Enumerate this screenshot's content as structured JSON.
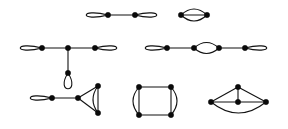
{
  "figure": {
    "width": 288,
    "height": 129,
    "background_color": "#ffffff",
    "vertex_color": "#0a0a0a",
    "edge_color": "#111111",
    "vertex_radius": 2.7,
    "edge_width": 1.1
  },
  "chart_data": {
    "type": "diagram",
    "graphs": [
      {
        "id": "graph-top-left",
        "label": "two looped vertices joined by an edge",
        "vertices": [
          {
            "id": "a",
            "x": 108,
            "y": 15
          },
          {
            "id": "b",
            "x": 135,
            "y": 15
          }
        ],
        "edges": [
          {
            "from": "a",
            "to": "b",
            "kind": "straight",
            "curve": 0
          }
        ],
        "loops": [
          {
            "at": "a",
            "direction": "left",
            "length": 29,
            "width": 15
          },
          {
            "at": "b",
            "direction": "right",
            "length": 29,
            "width": 15
          }
        ]
      },
      {
        "id": "graph-top-right",
        "label": "two vertices joined by three parallel edges",
        "vertices": [
          {
            "id": "a",
            "x": 181,
            "y": 15
          },
          {
            "id": "b",
            "x": 207,
            "y": 15
          }
        ],
        "edges": [
          {
            "from": "a",
            "to": "b",
            "kind": "arc",
            "curve": -6
          },
          {
            "from": "a",
            "to": "b",
            "kind": "straight",
            "curve": 0
          },
          {
            "from": "a",
            "to": "b",
            "kind": "arc",
            "curve": 6
          }
        ],
        "loops": []
      },
      {
        "id": "graph-middle-left",
        "label": "star with three looped leaves around a centre vertex",
        "vertices": [
          {
            "id": "c",
            "x": 68,
            "y": 48
          },
          {
            "id": "l",
            "x": 42,
            "y": 48
          },
          {
            "id": "r",
            "x": 95,
            "y": 48
          },
          {
            "id": "d",
            "x": 68,
            "y": 73
          }
        ],
        "edges": [
          {
            "from": "l",
            "to": "c",
            "kind": "straight",
            "curve": 0
          },
          {
            "from": "c",
            "to": "r",
            "kind": "straight",
            "curve": 0
          },
          {
            "from": "c",
            "to": "d",
            "kind": "straight",
            "curve": 0
          }
        ],
        "loops": [
          {
            "at": "l",
            "direction": "left",
            "length": 29,
            "width": 15
          },
          {
            "at": "r",
            "direction": "right",
            "length": 29,
            "width": 15
          },
          {
            "at": "d",
            "direction": "down",
            "length": 21,
            "width": 19
          }
        ]
      },
      {
        "id": "graph-middle-right",
        "label": "path of four vertices with end loops and a central double edge",
        "vertices": [
          {
            "id": "a",
            "x": 167,
            "y": 48
          },
          {
            "id": "b",
            "x": 194,
            "y": 48
          },
          {
            "id": "c",
            "x": 219,
            "y": 48
          },
          {
            "id": "d",
            "x": 245,
            "y": 48
          }
        ],
        "edges": [
          {
            "from": "a",
            "to": "b",
            "kind": "straight",
            "curve": 0
          },
          {
            "from": "b",
            "to": "c",
            "kind": "arc",
            "curve": -5.5
          },
          {
            "from": "b",
            "to": "c",
            "kind": "arc",
            "curve": 5.5
          },
          {
            "from": "c",
            "to": "d",
            "kind": "straight",
            "curve": 0
          }
        ],
        "loops": [
          {
            "at": "a",
            "direction": "left",
            "length": 29,
            "width": 15
          },
          {
            "at": "d",
            "direction": "right",
            "length": 29,
            "width": 15
          }
        ]
      },
      {
        "id": "graph-bottom-left",
        "label": "looped vertex attached to a triangle with one doubled side",
        "vertices": [
          {
            "id": "a",
            "x": 52,
            "y": 98
          },
          {
            "id": "b",
            "x": 78,
            "y": 98
          },
          {
            "id": "c",
            "x": 98,
            "y": 86
          },
          {
            "id": "d",
            "x": 98,
            "y": 113
          }
        ],
        "edges": [
          {
            "from": "a",
            "to": "b",
            "kind": "straight",
            "curve": 0
          },
          {
            "from": "b",
            "to": "c",
            "kind": "straight",
            "curve": 0
          },
          {
            "from": "b",
            "to": "d",
            "kind": "straight",
            "curve": 0
          },
          {
            "from": "c",
            "to": "d",
            "kind": "straight",
            "curve": 0
          },
          {
            "from": "c",
            "to": "d",
            "kind": "arc",
            "curve": 5
          }
        ],
        "loops": [
          {
            "at": "a",
            "direction": "left",
            "length": 29,
            "width": 15
          }
        ]
      },
      {
        "id": "graph-bottom-middle",
        "label": "four cycle with both vertical sides doubled",
        "vertices": [
          {
            "id": "tl",
            "x": 139,
            "y": 87
          },
          {
            "id": "tr",
            "x": 171,
            "y": 87
          },
          {
            "id": "bl",
            "x": 139,
            "y": 115
          },
          {
            "id": "br",
            "x": 171,
            "y": 115
          }
        ],
        "edges": [
          {
            "from": "tl",
            "to": "tr",
            "kind": "straight",
            "curve": 0
          },
          {
            "from": "bl",
            "to": "br",
            "kind": "straight",
            "curve": 0
          },
          {
            "from": "tl",
            "to": "bl",
            "kind": "straight",
            "curve": 0
          },
          {
            "from": "tl",
            "to": "bl",
            "kind": "arc",
            "curve": 6
          },
          {
            "from": "tr",
            "to": "br",
            "kind": "straight",
            "curve": 0
          },
          {
            "from": "tr",
            "to": "br",
            "kind": "arc",
            "curve": -6
          }
        ],
        "loops": []
      },
      {
        "id": "graph-bottom-right",
        "label": "apex joined to three collinear vertices with an outer arc",
        "vertices": [
          {
            "id": "t",
            "x": 238,
            "y": 87
          },
          {
            "id": "l",
            "x": 211,
            "y": 102
          },
          {
            "id": "m",
            "x": 238,
            "y": 102
          },
          {
            "id": "r",
            "x": 266,
            "y": 102
          }
        ],
        "edges": [
          {
            "from": "t",
            "to": "l",
            "kind": "straight",
            "curve": 0
          },
          {
            "from": "t",
            "to": "m",
            "kind": "straight",
            "curve": 0
          },
          {
            "from": "t",
            "to": "r",
            "kind": "straight",
            "curve": 0
          },
          {
            "from": "l",
            "to": "m",
            "kind": "straight",
            "curve": 0
          },
          {
            "from": "m",
            "to": "r",
            "kind": "straight",
            "curve": 0
          },
          {
            "from": "l",
            "to": "r",
            "kind": "arc",
            "curve": 11
          }
        ],
        "loops": []
      }
    ]
  }
}
